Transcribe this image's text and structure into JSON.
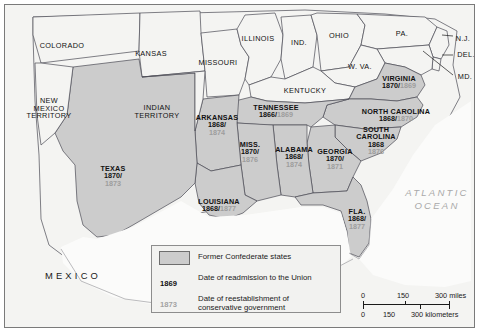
{
  "map": {
    "title": "Former Confederate states: readmission to the Union and reestablishment of conservative government",
    "ocean_label": "ATLANTIC\nOCEAN",
    "ocean_line1": "ATLANTIC",
    "ocean_line2": "OCEAN",
    "mexico_label": "MEXICO",
    "colors": {
      "confederate_fill": "#cccccc",
      "other_land_fill": "#f4f4f2",
      "water_fill": "#fbfbfa",
      "border_line": "#4a4a55",
      "readmission_date": "#111111",
      "conservative_date": "#9d9d9d",
      "frame": "#7a7a7a"
    }
  },
  "confederate_states": [
    {
      "name": "VIRGINIA",
      "readmitted": "1870",
      "conservative": "1869",
      "layout": "inline",
      "x": 394,
      "y": 77
    },
    {
      "name": "NORTH CAROLINA",
      "readmitted": "1868",
      "conservative": "1870",
      "layout": "inline",
      "x": 391,
      "y": 110
    },
    {
      "name": "SOUTH\nCAROLINA",
      "name_line1": "SOUTH",
      "name_line2": "CAROLINA",
      "readmitted": "1868",
      "conservative": "1876",
      "layout": "stacked-two-line-name",
      "x": 371,
      "y": 136
    },
    {
      "name": "GEORGIA",
      "readmitted": "1870",
      "conservative": "1871",
      "layout": "stacked",
      "x": 330,
      "y": 154
    },
    {
      "name": "FLA.",
      "readmitted": "1868",
      "conservative": "1877",
      "layout": "stacked",
      "x": 352,
      "y": 214
    },
    {
      "name": "ALABAMA",
      "readmitted": "1868",
      "conservative": "1874",
      "layout": "stacked",
      "x": 289,
      "y": 152
    },
    {
      "name": "MISS.",
      "readmitted": "1870",
      "conservative": "1876",
      "layout": "stacked",
      "x": 245,
      "y": 147
    },
    {
      "name": "TENNESSEE",
      "readmitted": "1866",
      "conservative": "1869",
      "layout": "inline",
      "x": 271,
      "y": 106
    },
    {
      "name": "ARKANSAS",
      "readmitted": "1868",
      "conservative": "1874",
      "layout": "stacked",
      "x": 212,
      "y": 120
    },
    {
      "name": "LOUISIANA",
      "readmitted": "1868",
      "conservative": "1877",
      "layout": "inline",
      "x": 214,
      "y": 200
    },
    {
      "name": "TEXAS",
      "readmitted": "1870",
      "conservative": "1873",
      "layout": "stacked",
      "x": 108,
      "y": 171
    }
  ],
  "other_places": [
    {
      "name": "COLORADO",
      "x": 57,
      "y": 41
    },
    {
      "name": "KANSAS",
      "x": 146,
      "y": 49
    },
    {
      "name": "MISSOURI",
      "x": 213,
      "y": 58
    },
    {
      "name": "ILLINOIS",
      "x": 253,
      "y": 34
    },
    {
      "name": "IND.",
      "x": 294,
      "y": 38
    },
    {
      "name": "OHIO",
      "x": 334,
      "y": 31
    },
    {
      "name": "PA.",
      "x": 397,
      "y": 29
    },
    {
      "name": "N.J.",
      "x": 458,
      "y": 34
    },
    {
      "name": "DEL.",
      "x": 461,
      "y": 50
    },
    {
      "name": "MD.",
      "x": 460,
      "y": 72
    },
    {
      "name": "W. VA.",
      "x": 355,
      "y": 62
    },
    {
      "name": "KENTUCKY",
      "x": 300,
      "y": 86
    },
    {
      "name": "NEW\nMEXICO\nTERRITORY",
      "line1": "NEW",
      "line2": "MEXICO",
      "line3": "TERRITORY",
      "x": 44,
      "y": 103
    },
    {
      "name": "INDIAN\nTERRITORY",
      "line1": "INDIAN",
      "line2": "TERRITORY",
      "x": 152,
      "y": 107
    }
  ],
  "legend": {
    "swatch_label": "Former Confederate states",
    "readmission_year_sample": "1869",
    "readmission_text": "Date of readmission to the Union",
    "conservative_year_sample": "1873",
    "conservative_text_line1": "Date of reestablishment of",
    "conservative_text_line2": "conservative government"
  },
  "scale_bar": {
    "miles": {
      "ticks": [
        "0",
        "150",
        "300"
      ],
      "unit": "miles",
      "end_label": "300 miles"
    },
    "kilometers": {
      "ticks": [
        "0",
        "150",
        "300"
      ],
      "unit": "kilometers",
      "end_label": "300 kilometers"
    }
  }
}
